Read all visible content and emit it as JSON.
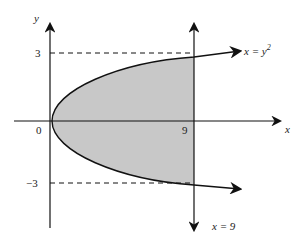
{
  "diagram": {
    "title": "",
    "axes": {
      "x_label": "x",
      "y_label": "y"
    },
    "ticks": {
      "y_pos": "3",
      "y_neg": "−3",
      "origin": "0",
      "x_nine": "9"
    },
    "curves": {
      "parabola_label_lhs": "x = y",
      "parabola_label_exp": "2",
      "vertical_line_label": "x = 9"
    },
    "colors": {
      "shade": "#c8c8c8",
      "stroke": "#111111",
      "text": "#222222"
    }
  }
}
